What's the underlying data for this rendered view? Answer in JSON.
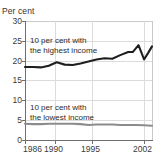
{
  "chart_data": {
    "type": "line",
    "title": "",
    "subtitle": "",
    "xlabel": "",
    "ylabel": "Per cent",
    "ylim": [
      0,
      30
    ],
    "xlim": [
      1986,
      2002
    ],
    "ytick_labels": [
      "0",
      "5",
      "10",
      "15",
      "20",
      "25",
      "30"
    ],
    "ytick_values": [
      0,
      5,
      10,
      15,
      20,
      25,
      30
    ],
    "xtick_labels": [
      "1986",
      "1990",
      "1995",
      "2002"
    ],
    "xtick_values": [
      1986,
      1990,
      1995,
      2002
    ],
    "grid": true,
    "legend_position": "inline-annotations",
    "x": [
      1986,
      1987,
      1988,
      1989,
      1990,
      1991,
      1992,
      1993,
      1994,
      1995,
      1996,
      1997,
      1998,
      1999,
      2000,
      2001,
      2002
    ],
    "series": [
      {
        "name": "10 per cent with the highest income",
        "color": "#1f1f1f",
        "values": [
          18.4,
          18.4,
          18.3,
          18.7,
          19.6,
          19.0,
          18.9,
          19.3,
          19.8,
          20.3,
          20.6,
          20.5,
          21.4,
          22.2,
          22.0,
          22.5,
          23.9
        ]
      },
      {
        "name": "10 per cent with the lowest income",
        "color": "#8c8c8c",
        "values": [
          4.1,
          4.0,
          4.0,
          4.1,
          4.1,
          4.1,
          4.1,
          4.0,
          3.8,
          3.9,
          3.9,
          3.9,
          3.8,
          3.8,
          3.8,
          3.7,
          3.6
        ]
      }
    ],
    "series_high_extra": {
      "note": "late-period detail: peak at 2000-01 then sharp dip and recovery",
      "x_extra": [
        1999.6,
        2000.3,
        2001.0,
        2001.5,
        2002.0
      ],
      "y_extra": [
        22.2,
        23.9,
        20.3,
        21.9,
        23.6
      ]
    },
    "annotations": [
      {
        "id": "label-high",
        "text_line1": "10 per cent with",
        "text_line2": "the highest income"
      },
      {
        "id": "label-low",
        "text_line1": "10 per cent with",
        "text_line2": "the lowest income"
      }
    ]
  },
  "axis": {
    "y_title": "Per cent"
  },
  "top_clip": {
    "text": ""
  },
  "colors": {
    "high_income_line": "#1f1f1f",
    "low_income_line": "#8c8c8c",
    "grid": "#dcdcdc",
    "axis": "#6f6f6f",
    "text": "#3a3a3a",
    "background": "#ffffff"
  }
}
